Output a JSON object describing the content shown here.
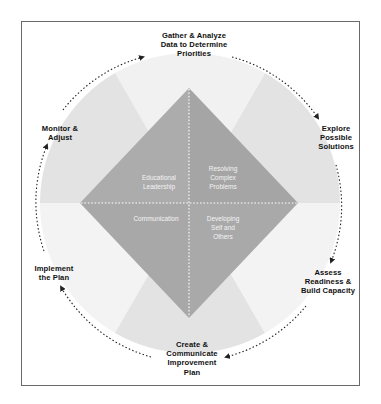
{
  "diagram": {
    "title": "",
    "colors": {
      "frame_border": "#6a6a6a",
      "wedge_light": "#f1f1f1",
      "wedge_dark": "#e3e3e3",
      "diamond_fill": "#ababab",
      "diamond_fill_alt": "#a5a5a5",
      "diamond_divider": "#ffffff",
      "cycle_arrow": "#222222",
      "step_text": "#111111",
      "quadrant_text": "#f4f4f4"
    },
    "cycle_steps": [
      {
        "id": "gather",
        "label": "Gather & Analyze\nData to Determine\nPriorities"
      },
      {
        "id": "explore",
        "label": "Explore\nPossible\nSolutions"
      },
      {
        "id": "assess",
        "label": "Assess\nReadiness &\nBuild Capacity"
      },
      {
        "id": "create",
        "label": "Create &\nCommunicate\nImprovement\nPlan"
      },
      {
        "id": "implement",
        "label": "Implement\nthe Plan"
      },
      {
        "id": "monitor",
        "label": "Monitor &\nAdjust"
      }
    ],
    "quadrants": [
      {
        "id": "educational-leadership",
        "position": "top-left",
        "label": "Educational\nLeadership"
      },
      {
        "id": "resolving-complex-problems",
        "position": "top-right",
        "label": "Resolving\nComplex\nProblems"
      },
      {
        "id": "communication",
        "position": "bottom-left",
        "label": "Communication"
      },
      {
        "id": "developing-self-and-others",
        "position": "bottom-right",
        "label": "Developing\nSelf and\nOthers"
      }
    ],
    "cycle_direction": "clockwise",
    "icons": {
      "arrowhead": "arrowhead-icon"
    }
  }
}
